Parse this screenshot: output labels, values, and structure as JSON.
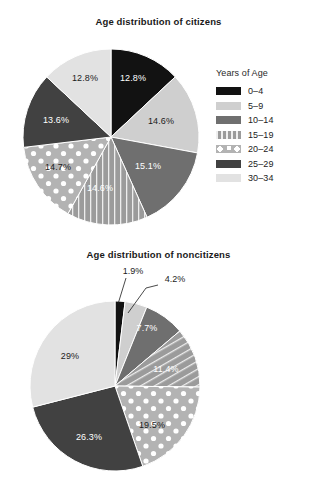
{
  "legend": {
    "title": "Years of Age",
    "entries": [
      {
        "label": "0–4",
        "swatch": "solid-black",
        "color": "#121212"
      },
      {
        "label": "5–9",
        "swatch": "solid-lightgrey",
        "color": "#cfcfcf"
      },
      {
        "label": "10–14",
        "swatch": "solid-midgrey",
        "color": "#6f6f6f"
      },
      {
        "label": "15–19",
        "swatch": "vertical-lines",
        "color": "#9b9b9b"
      },
      {
        "label": "20–24",
        "swatch": "dots",
        "color": "#b3b3b3"
      },
      {
        "label": "25–29",
        "swatch": "solid-darkgrey",
        "color": "#414141"
      },
      {
        "label": "30–34",
        "swatch": "solid-palegrey",
        "color": "#e2e2e2"
      }
    ]
  },
  "charts": [
    {
      "id": "citizens",
      "title": "Age distribution of citizens",
      "labels": [
        "12.8%",
        "14.6%",
        "15.1%",
        "14.6%",
        "14.7%",
        "13.6%",
        "12.8%"
      ]
    },
    {
      "id": "noncitizens",
      "title": "Age distribution of noncitizens",
      "labels": [
        "1.9%",
        "4.2%",
        "7.7%",
        "11.4%",
        "19.5%",
        "26.3%",
        "29%"
      ]
    }
  ],
  "chart_data": [
    {
      "type": "pie",
      "title": "Age distribution of citizens",
      "categories": [
        "0–4",
        "5–9",
        "10–14",
        "15–19",
        "20–24",
        "25–29",
        "30–34"
      ],
      "values": [
        12.8,
        14.6,
        15.1,
        14.6,
        14.7,
        13.6,
        12.8
      ],
      "value_labels": [
        "12.8%",
        "14.6%",
        "15.1%",
        "14.6%",
        "14.7%",
        "13.6%",
        "12.8%"
      ],
      "unit": "%",
      "legend_title": "Years of Age",
      "legend_position": "right",
      "start_angle_deg": 0,
      "direction": "clockwise",
      "slice_styles": [
        "solid-black",
        "solid-lightgrey",
        "solid-midgrey",
        "vertical-lines",
        "dots",
        "solid-darkgrey",
        "solid-palegrey"
      ],
      "slice_colors": [
        "#121212",
        "#cfcfcf",
        "#6f6f6f",
        "#9b9b9b",
        "#b3b3b3",
        "#414141",
        "#e2e2e2"
      ]
    },
    {
      "type": "pie",
      "title": "Age distribution of noncitizens",
      "categories": [
        "0–4",
        "5–9",
        "10–14",
        "15–19",
        "20–24",
        "25–29",
        "30–34"
      ],
      "values": [
        1.9,
        4.2,
        7.7,
        11.4,
        19.5,
        26.3,
        29.0
      ],
      "value_labels": [
        "1.9%",
        "4.2%",
        "7.7%",
        "11.4%",
        "19.5%",
        "26.3%",
        "29%"
      ],
      "unit": "%",
      "legend_title": "Years of Age",
      "legend_position": "right",
      "start_angle_deg": 0,
      "direction": "clockwise",
      "slice_styles": [
        "solid-black",
        "solid-lightgrey",
        "solid-midgrey",
        "vertical-lines",
        "dots",
        "solid-darkgrey",
        "solid-palegrey"
      ],
      "slice_colors": [
        "#121212",
        "#cfcfcf",
        "#6f6f6f",
        "#9b9b9b",
        "#b3b3b3",
        "#414141",
        "#e2e2e2"
      ]
    }
  ]
}
